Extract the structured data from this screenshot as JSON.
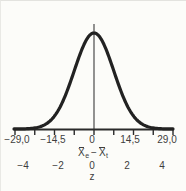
{
  "colors": {
    "curve": "#222222",
    "axis": "#2b2b2b",
    "mean_line": "#4a4a4a",
    "text": "#3e3e3e",
    "background": "#fcfcf9"
  },
  "chart_data": {
    "type": "line",
    "title": "",
    "curve": {
      "shape": "gaussian",
      "description": "standard normal distribution bell curve with vertical line at the mean",
      "mean_z": 0,
      "sigma_z": 1,
      "z_domain": [
        -4,
        4
      ]
    },
    "axes": [
      {
        "id": "mean-difference",
        "label": "X̄e − X̄t",
        "label_parts": {
          "x1": "X",
          "sub1": "e",
          "minus": "−",
          "x2": "X",
          "sub2": "t"
        },
        "tick_labels": [
          "−29,0",
          "−14,5",
          "0",
          "14,5",
          "29,0"
        ],
        "tick_values": [
          -29.0,
          -14.5,
          0,
          14.5,
          29.0
        ],
        "range": [
          -29.0,
          29.0
        ],
        "decimal_separator": ","
      },
      {
        "id": "z-score",
        "label": "z",
        "tick_labels": [
          "−4",
          "−2",
          "0",
          "2",
          "4"
        ],
        "tick_values": [
          -4,
          -2,
          0,
          2,
          4
        ],
        "minor_tick_step": 1,
        "range": [
          -4,
          4
        ]
      }
    ],
    "layout": {
      "grid": false,
      "legend": false,
      "plot": {
        "center_x": 93,
        "px_per_z": 19.75,
        "baseline_y": 128,
        "amplitude_px": 96,
        "x_left": 13,
        "x_right": 172,
        "centerline_top_y": 23,
        "tick_len": 5,
        "minor_tick_z_step": 1
      }
    }
  }
}
